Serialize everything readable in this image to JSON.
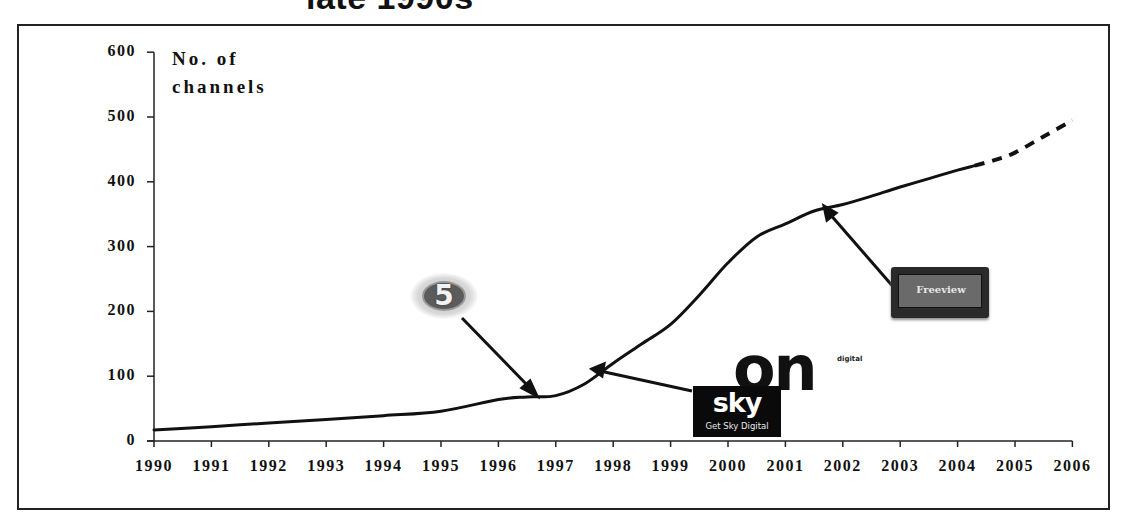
{
  "slide": {
    "title_fragment": "late 1990s"
  },
  "chart_data": {
    "type": "line",
    "title": "",
    "xlabel": "",
    "ylabel": "No. of channels",
    "ylabel_lines": [
      "No. of",
      "channels"
    ],
    "ylim": [
      0,
      600
    ],
    "yticks": [
      "0",
      "100",
      "200",
      "300",
      "400",
      "500",
      "600"
    ],
    "xlim": [
      1990,
      2006
    ],
    "xticks": [
      "1990",
      "1991",
      "1992",
      "1993",
      "1994",
      "1995",
      "1996",
      "1997",
      "1998",
      "1999",
      "2000",
      "2001",
      "2002",
      "2003",
      "2004",
      "2005",
      "2006"
    ],
    "grid": false,
    "legend": "none",
    "series": [
      {
        "name": "No. of channels (actual)",
        "style": "solid",
        "x": [
          1990,
          1991,
          1992,
          1993,
          1994,
          1995,
          1996,
          1996.5,
          1997,
          1997.5,
          1998,
          1998.5,
          1999,
          1999.5,
          2000,
          2000.5,
          2001,
          2001.5,
          2002,
          2002.5,
          2003,
          2003.5,
          2004,
          2004.3
        ],
        "values": [
          17,
          22,
          28,
          33,
          39,
          46,
          64,
          68,
          70,
          88,
          120,
          150,
          180,
          225,
          275,
          315,
          335,
          355,
          365,
          378,
          392,
          405,
          418,
          425
        ]
      },
      {
        "name": "No. of channels (projected)",
        "style": "dashed",
        "x": [
          2004.3,
          2004.7,
          2005,
          2005.5,
          2006
        ],
        "values": [
          425,
          435,
          445,
          470,
          495
        ]
      }
    ],
    "annotations": [
      {
        "label": "5",
        "description": "Channel 5 logo",
        "points_to_year": 1996.7,
        "points_to_value": 68
      },
      {
        "label": "sky",
        "sublabel": "Get Sky Digital",
        "description": "Sky Digital logo",
        "points_to_year": 1997.7,
        "points_to_value": 109
      },
      {
        "label": "on",
        "sublabel": "digital",
        "description": "ONdigital logo"
      },
      {
        "label": "Freeview",
        "description": "Freeview logo",
        "points_to_year": 2001.7,
        "points_to_value": 363
      }
    ]
  }
}
